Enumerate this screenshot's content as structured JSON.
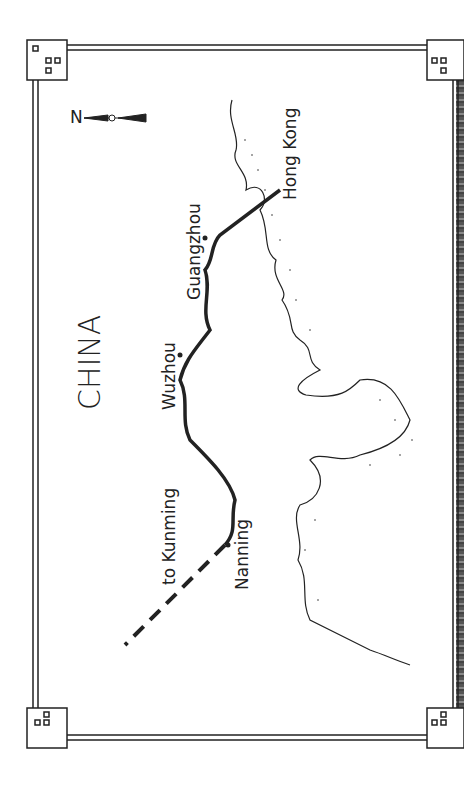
{
  "map": {
    "country_label": "CHINA",
    "compass": {
      "label": "N"
    },
    "places": [
      {
        "name": "Hong Kong"
      },
      {
        "name": "Guangzhou"
      },
      {
        "name": "Wuzhou"
      },
      {
        "name": "Nanning"
      },
      {
        "name": "to Kunming"
      }
    ],
    "colors": {
      "ink": "#222222",
      "paper": "#ffffff"
    }
  }
}
